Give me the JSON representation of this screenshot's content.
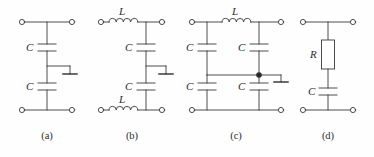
{
  "figure": {
    "type": "circuit-schematic-figure",
    "panel_count": 4,
    "stroke_color": "#3a3a3a",
    "background_color": "#fefefe",
    "label_color": "#2b2b2b"
  },
  "panels": [
    {
      "id": "a",
      "caption": "(a)",
      "description": "Two series capacitors in shunt branch with center ground tap",
      "components": [
        {
          "type": "capacitor",
          "label": "C",
          "name": "capacitor-a-top"
        },
        {
          "type": "capacitor",
          "label": "C",
          "name": "capacitor-a-bottom"
        },
        {
          "type": "ground",
          "label": "",
          "name": "ground-a"
        }
      ],
      "terminals": 4
    },
    {
      "id": "b",
      "caption": "(b)",
      "description": "Series inductors on both rails with two shunt capacitors and center ground tap",
      "components": [
        {
          "type": "inductor",
          "label": "L",
          "name": "inductor-b-top"
        },
        {
          "type": "inductor",
          "label": "L",
          "name": "inductor-b-bottom"
        },
        {
          "type": "capacitor",
          "label": "C",
          "name": "capacitor-b-top"
        },
        {
          "type": "capacitor",
          "label": "C",
          "name": "capacitor-b-bottom"
        },
        {
          "type": "ground",
          "label": "",
          "name": "ground-b"
        }
      ],
      "terminals": 4
    },
    {
      "id": "c",
      "caption": "(c)",
      "description": "Series inductor with four capacitors in bridged-T lattice and center ground tap at junction node",
      "components": [
        {
          "type": "inductor",
          "label": "L",
          "name": "inductor-c-top"
        },
        {
          "type": "capacitor",
          "label": "C",
          "name": "capacitor-c-left-top"
        },
        {
          "type": "capacitor",
          "label": "C",
          "name": "capacitor-c-right-top"
        },
        {
          "type": "capacitor",
          "label": "C",
          "name": "capacitor-c-left-bottom"
        },
        {
          "type": "capacitor",
          "label": "C",
          "name": "capacitor-c-right-bottom"
        },
        {
          "type": "junction",
          "label": "",
          "name": "junction-dot-c"
        },
        {
          "type": "ground",
          "label": "",
          "name": "ground-c"
        }
      ],
      "terminals": 4
    },
    {
      "id": "d",
      "caption": "(d)",
      "description": "Series resistor above shunt capacitor",
      "components": [
        {
          "type": "resistor",
          "label": "R",
          "name": "resistor-d"
        },
        {
          "type": "capacitor",
          "label": "C",
          "name": "capacitor-d"
        }
      ],
      "terminals": 4
    }
  ],
  "labels": {
    "panel_a_cap_top": "C",
    "panel_a_cap_bottom": "C",
    "panel_a_caption": "(a)",
    "panel_b_ind_top": "L",
    "panel_b_ind_bottom": "L",
    "panel_b_cap_top": "C",
    "panel_b_cap_bottom": "C",
    "panel_b_caption": "(b)",
    "panel_c_ind_top": "L",
    "panel_c_cap_lt": "C",
    "panel_c_cap_rt": "C",
    "panel_c_cap_lb": "C",
    "panel_c_cap_rb": "C",
    "panel_c_caption": "(c)",
    "panel_d_res": "R",
    "panel_d_cap": "C",
    "panel_d_caption": "(d)"
  }
}
